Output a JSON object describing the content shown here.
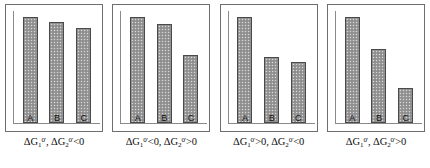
{
  "figure": {
    "title": "",
    "panel_count": 4,
    "bar_series_labels": [
      "A",
      "B",
      "C"
    ]
  },
  "chart_data": [
    {
      "type": "bar",
      "panel_index": 1,
      "categories": [
        "A",
        "B",
        "C"
      ],
      "values": [
        100,
        95,
        90
      ],
      "title": "",
      "caption_plain": "ΔG1°', ΔG2°' <0",
      "caption_parts": {
        "delta1": "ΔG",
        "sub1": "1",
        "sup1": "0'",
        "sep": ", ",
        "delta2": "ΔG",
        "sub2": "2",
        "sup2": "0'",
        "relation": "<0"
      },
      "xlabel": "",
      "ylabel": "",
      "ylim": [
        0,
        100
      ],
      "grid": false,
      "legend": "none"
    },
    {
      "type": "bar",
      "panel_index": 2,
      "categories": [
        "A",
        "B",
        "C"
      ],
      "values": [
        100,
        94,
        64
      ],
      "title": "",
      "caption_plain": "ΔG1°' <0, ΔG2°' >0",
      "caption_parts": {
        "delta1": "ΔG",
        "sub1": "1",
        "sup1": "0'",
        "relation1": "<0",
        "sep": ", ",
        "delta2": "ΔG",
        "sub2": "2",
        "sup2": "0'",
        "relation2": ">0"
      },
      "xlabel": "",
      "ylabel": "",
      "ylim": [
        0,
        100
      ],
      "grid": false,
      "legend": "none"
    },
    {
      "type": "bar",
      "panel_index": 3,
      "categories": [
        "A",
        "B",
        "C"
      ],
      "values": [
        100,
        62,
        58
      ],
      "title": "",
      "caption_plain": "ΔG1°' >0, ΔG2°' <0",
      "caption_parts": {
        "delta1": "ΔG",
        "sub1": "1",
        "sup1": "0'",
        "relation1": ">0",
        "sep": ", ",
        "delta2": "ΔG",
        "sub2": "2",
        "sup2": "0'",
        "relation2": "<0"
      },
      "xlabel": "",
      "ylabel": "",
      "ylim": [
        0,
        100
      ],
      "grid": false,
      "legend": "none"
    },
    {
      "type": "bar",
      "panel_index": 4,
      "categories": [
        "A",
        "B",
        "C"
      ],
      "values": [
        100,
        70,
        33
      ],
      "title": "",
      "caption_plain": "ΔG1°', ΔG2°' >0",
      "caption_parts": {
        "delta1": "ΔG",
        "sub1": "1",
        "sup1": "0'",
        "sep": ", ",
        "delta2": "ΔG",
        "sub2": "2",
        "sup2": "0'",
        "relation": ">0"
      },
      "xlabel": "",
      "ylabel": "",
      "ylim": [
        0,
        100
      ],
      "grid": false,
      "legend": "none"
    }
  ],
  "style": {
    "bar_fill": "#9a9a9a",
    "bar_stroke": "#4a4a4a",
    "axis_color": "#8a8a8a",
    "panel_border": "#6e6e6e",
    "background": "#ffffff",
    "text_color": "#0d0d0d"
  }
}
